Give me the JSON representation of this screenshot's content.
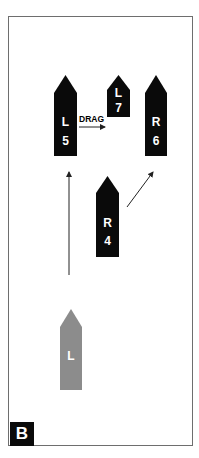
{
  "panel": {
    "label": "B"
  },
  "colors": {
    "boat": "#0a0a0a",
    "ghost_boat": "#8c8c8c",
    "arrow": "#222222",
    "frame": "#6e6e6e"
  },
  "boats": [
    {
      "id": "L5",
      "side": "L",
      "number": "5",
      "color": "#0a0a0a",
      "x": 54,
      "w": 23,
      "tip": 75,
      "shoulder": 93,
      "bottom": 156,
      "side_y": 126,
      "num_y": 145
    },
    {
      "id": "L7",
      "side": "L",
      "number": "7",
      "color": "#0a0a0a",
      "x": 107,
      "w": 23,
      "tip": 75,
      "shoulder": 90,
      "bottom": 117,
      "side_y": 97,
      "num_y": 112
    },
    {
      "id": "R6",
      "side": "R",
      "number": "6",
      "color": "#0a0a0a",
      "x": 145,
      "w": 22,
      "tip": 75,
      "shoulder": 93,
      "bottom": 156,
      "side_y": 126,
      "num_y": 145
    },
    {
      "id": "R4",
      "side": "R",
      "number": "4",
      "color": "#0a0a0a",
      "x": 96,
      "w": 23,
      "tip": 176,
      "shoulder": 193,
      "bottom": 257,
      "side_y": 227,
      "num_y": 245
    },
    {
      "id": "L-start",
      "side": "L",
      "number": "",
      "color": "#8c8c8c",
      "x": 60,
      "w": 22,
      "tip": 309,
      "shoulder": 327,
      "bottom": 390,
      "side_y": 360,
      "num_y": 0
    }
  ],
  "annotations": {
    "drag_label": "DRAG"
  },
  "arrows": [
    {
      "id": "drag-arrow",
      "x1": 79,
      "y1": 127,
      "x2": 105,
      "y2": 127
    },
    {
      "id": "forward-arrow",
      "x1": 69,
      "y1": 275,
      "x2": 69,
      "y2": 172
    },
    {
      "id": "diagonal-arrow",
      "x1": 127,
      "y1": 207,
      "x2": 153,
      "y2": 172
    }
  ]
}
